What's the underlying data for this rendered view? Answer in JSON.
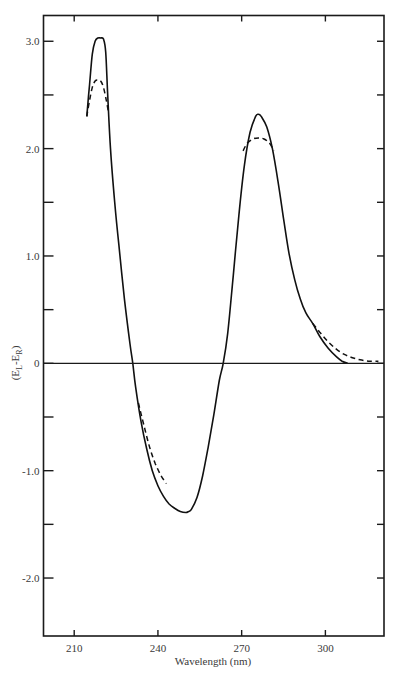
{
  "chart_data": {
    "type": "line",
    "title": "",
    "xlabel": "Wavelength (nm)",
    "ylabel": "(E_L-E_R)",
    "ylabel_main": "(E",
    "ylabel_sub1": "L",
    "ylabel_mid": "-E",
    "ylabel_sub2": "R",
    "ylabel_end": ")",
    "xlim": [
      199,
      321
    ],
    "ylim": [
      -2.54,
      3.24
    ],
    "grid": false,
    "legend": null,
    "x_ticks": [
      210,
      240,
      270,
      300
    ],
    "x_tick_labels": [
      "210",
      "240",
      "270",
      "300"
    ],
    "y_ticks": [
      3.0,
      2.0,
      1.0,
      0,
      -1.0,
      -2.0
    ],
    "y_tick_labels": [
      "3.0",
      "2.0",
      "1.0",
      "0",
      "-1.0",
      "-2.0"
    ],
    "y_minor_ticks": [
      2.5,
      1.5,
      0.5,
      -0.5,
      -1.5
    ],
    "zero_line": true,
    "series": [
      {
        "name": "solid curve",
        "style": "solid",
        "x": [
          214.5,
          215.5,
          216.5,
          217.5,
          218.5,
          219.5,
          220.5,
          221.3,
          222,
          223,
          224.5,
          226,
          228,
          230,
          231,
          232,
          234,
          236,
          238,
          240,
          242,
          244,
          246,
          248,
          250,
          251,
          252,
          254,
          256,
          258,
          260,
          262,
          263.4,
          265,
          267,
          269,
          271,
          273,
          275,
          276,
          277,
          279,
          281,
          283,
          285,
          287,
          289,
          291,
          293,
          295.5,
          298,
          301,
          304,
          306,
          308
        ],
        "y": [
          2.3,
          2.6,
          2.88,
          3.0,
          3.03,
          3.03,
          3.02,
          2.9,
          2.5,
          2.0,
          1.5,
          1.1,
          0.6,
          0.18,
          0.0,
          -0.22,
          -0.55,
          -0.8,
          -1.0,
          -1.14,
          -1.24,
          -1.31,
          -1.35,
          -1.38,
          -1.39,
          -1.38,
          -1.36,
          -1.25,
          -1.05,
          -0.78,
          -0.48,
          -0.16,
          0.0,
          0.28,
          0.82,
          1.38,
          1.85,
          2.15,
          2.3,
          2.32,
          2.3,
          2.2,
          2.0,
          1.7,
          1.35,
          1.02,
          0.78,
          0.6,
          0.47,
          0.37,
          0.25,
          0.14,
          0.06,
          0.02,
          0.0
        ]
      },
      {
        "name": "dashed curve (peak 1)",
        "style": "dashed",
        "x": [
          214.5,
          215.5,
          216.5,
          217.5,
          218.5,
          219.5,
          220.5,
          221.5,
          222.2
        ],
        "y": [
          2.3,
          2.45,
          2.57,
          2.63,
          2.64,
          2.63,
          2.57,
          2.45,
          2.35
        ]
      },
      {
        "name": "dashed curve (trough)",
        "style": "dashed",
        "x": [
          233,
          235,
          237,
          239,
          241,
          243
        ],
        "y": [
          -0.37,
          -0.58,
          -0.78,
          -0.93,
          -1.04,
          -1.12
        ]
      },
      {
        "name": "dashed curve (peak 2)",
        "style": "dashed",
        "x": [
          270.5,
          272,
          274,
          276,
          278,
          280,
          281.5
        ],
        "y": [
          1.98,
          2.05,
          2.09,
          2.1,
          2.09,
          2.05,
          1.98
        ]
      },
      {
        "name": "dashed curve (tail)",
        "style": "dashed",
        "x": [
          295.5,
          298,
          301,
          304,
          307,
          310,
          313,
          316,
          319
        ],
        "y": [
          0.37,
          0.29,
          0.2,
          0.13,
          0.08,
          0.05,
          0.03,
          0.02,
          0.02
        ]
      }
    ]
  },
  "layout": {
    "plot_left": 43.5,
    "plot_top": 15.5,
    "plot_right": 384,
    "plot_bottom": 636
  }
}
